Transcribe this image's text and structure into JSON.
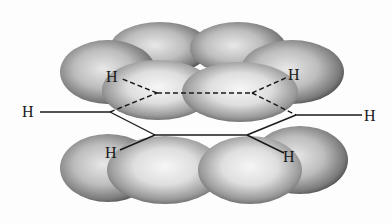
{
  "diagram": {
    "atoms": {
      "h_left": "H",
      "h_right": "H",
      "h_back_left": "H",
      "h_back_right": "H",
      "h_front_left": "H",
      "h_front_right": "H"
    },
    "colors": {
      "background": "#fdfdfd",
      "lobe_light": "#f2f2f2",
      "lobe_dark": "#555555",
      "bond": "#1a1a1a"
    }
  }
}
